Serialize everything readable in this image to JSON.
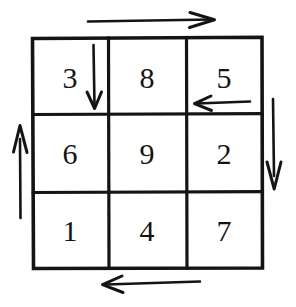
{
  "figure": {
    "title": "",
    "type": "number-grid-with-path-arrows",
    "ink_color": "#141414",
    "background_color": "#ffffff"
  },
  "grid": {
    "rows": 3,
    "columns": 3,
    "cells": [
      [
        {
          "value": "3",
          "name": "cell-r1c1"
        },
        {
          "value": "8",
          "name": "cell-r1c2"
        },
        {
          "value": "5",
          "name": "cell-r1c3"
        }
      ],
      [
        {
          "value": "6",
          "name": "cell-r2c1"
        },
        {
          "value": "9",
          "name": "cell-r2c2"
        },
        {
          "value": "2",
          "name": "cell-r2c3"
        }
      ],
      [
        {
          "value": "1",
          "name": "cell-r3c1"
        },
        {
          "value": "4",
          "name": "cell-r3c2"
        },
        {
          "value": "7",
          "name": "cell-r3c3"
        }
      ]
    ]
  },
  "arrows": [
    {
      "name": "arrow-top-right",
      "direction": "right",
      "position": "above-grid",
      "label": ""
    },
    {
      "name": "arrow-inner-down",
      "direction": "down",
      "position": "inside-top-left-cell",
      "label": ""
    },
    {
      "name": "arrow-inner-left",
      "direction": "left",
      "position": "inside-top-right-cell",
      "label": ""
    },
    {
      "name": "arrow-right-down",
      "direction": "down",
      "position": "right-of-grid",
      "label": ""
    },
    {
      "name": "arrow-bottom-left",
      "direction": "left",
      "position": "below-grid",
      "label": ""
    },
    {
      "name": "arrow-left-up",
      "direction": "up",
      "position": "left-of-grid",
      "label": ""
    }
  ]
}
